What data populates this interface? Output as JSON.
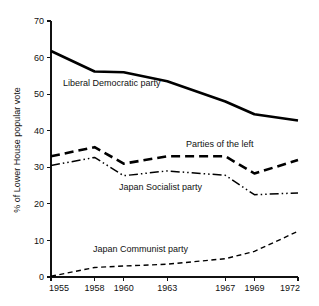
{
  "chart_data": {
    "type": "line",
    "title": "",
    "xlabel": "",
    "ylabel": "% of Lower House popular vote",
    "x": [
      1955,
      1958,
      1960,
      1963,
      1967,
      1969,
      1972
    ],
    "xtick_labels": [
      "1955",
      "1958",
      "1960",
      "1963",
      "1967",
      "1969",
      "1972"
    ],
    "ytick_labels": [
      "0",
      "10",
      "20",
      "30",
      "40",
      "50",
      "60",
      "70"
    ],
    "ytick_values": [
      0,
      10,
      20,
      30,
      40,
      50,
      60,
      70
    ],
    "xlim": [
      1955,
      1972
    ],
    "ylim": [
      0,
      70
    ],
    "grid": false,
    "legend_position": "inline-annotations",
    "series": [
      {
        "name": "Liberal Democratic party",
        "style": "solid-heavy",
        "values": [
          61.8,
          56.2,
          56.0,
          53.5,
          48.0,
          44.5,
          42.8
        ]
      },
      {
        "name": "Parties of the left",
        "style": "dashed-heavy",
        "values": [
          33.0,
          35.5,
          31.0,
          33.0,
          33.0,
          28.3,
          32.0
        ]
      },
      {
        "name": "Japan Socialist party",
        "style": "dash-dot-dot",
        "values": [
          30.5,
          32.7,
          27.7,
          29.0,
          27.8,
          22.5,
          23.0
        ]
      },
      {
        "name": "Japan Communist party",
        "style": "dashed-fine",
        "values": [
          0.2,
          2.6,
          3.0,
          3.5,
          5.0,
          7.0,
          12.5
        ]
      }
    ],
    "annotations": [
      {
        "text": "Liberal Democratic party",
        "x_px": 63,
        "y_px": 86
      },
      {
        "text": "Parties of the left",
        "x_px": 186,
        "y_px": 147
      },
      {
        "text": "Japan Socialist party",
        "x_px": 119,
        "y_px": 190
      },
      {
        "text": "Japan Communist party",
        "x_px": 93,
        "y_px": 252
      }
    ]
  },
  "axis": {
    "y_title": "% of Lower House popular vote"
  }
}
